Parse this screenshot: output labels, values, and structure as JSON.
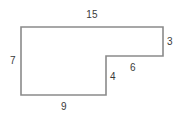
{
  "figure": {
    "kind": "geometry-diagram",
    "canvas": {
      "width": 187,
      "height": 120
    },
    "colors": {
      "background": "#ffffff",
      "stroke": "#8a8a8a",
      "fill": "#ffffff",
      "text": "#3a3a3a"
    },
    "stroke_width": 1.6,
    "polygon": {
      "points": "21,27 163,27 163,56 106,56 106,95 21,95",
      "vertices": [
        {
          "name": "top-left",
          "x": 21,
          "y": 27
        },
        {
          "name": "top-right",
          "x": 163,
          "y": 27
        },
        {
          "name": "right-bottom",
          "x": 163,
          "y": 56
        },
        {
          "name": "notch-corner",
          "x": 106,
          "y": 56
        },
        {
          "name": "notch-bottom",
          "x": 106,
          "y": 95
        },
        {
          "name": "bottom-left",
          "x": 21,
          "y": 95
        }
      ]
    },
    "labels": [
      {
        "name": "top-side",
        "text": "15",
        "x": 92,
        "y": 15
      },
      {
        "name": "right-side",
        "text": "3",
        "x": 170,
        "y": 42
      },
      {
        "name": "notch-top-side",
        "text": "6",
        "x": 133,
        "y": 68
      },
      {
        "name": "notch-vertical-side",
        "text": "4",
        "x": 113,
        "y": 77
      },
      {
        "name": "left-side",
        "text": "7",
        "x": 13,
        "y": 61
      },
      {
        "name": "bottom-side",
        "text": "9",
        "x": 64,
        "y": 107
      }
    ]
  }
}
